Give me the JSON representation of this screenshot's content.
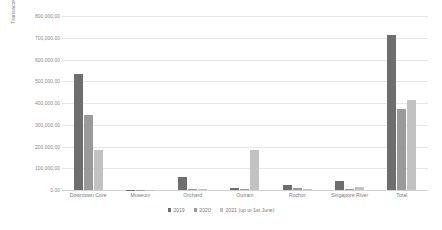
{
  "chart_data": {
    "type": "bar",
    "title": "",
    "xlabel": "",
    "ylabel": "Transacted Area (sqft)",
    "ylim": [
      0,
      800000
    ],
    "grid": true,
    "legend_position": "bottom",
    "categories": [
      "Downtown Core",
      "Museum",
      "Orchard",
      "Outram",
      "Rochor",
      "Singapore River",
      "Total"
    ],
    "ytick_labels": [
      "800,000.00",
      "700,000.00",
      "600,000.00",
      "500,000.00",
      "400,000.00",
      "300,000.00",
      "200,000.00",
      "100,000.00",
      "0.00"
    ],
    "ytick_values": [
      800000,
      700000,
      600000,
      500000,
      400000,
      300000,
      200000,
      100000,
      0
    ],
    "series": [
      {
        "name": "2019",
        "color": "#6e6e6e",
        "values": [
          535000,
          500,
          62000,
          9000,
          22000,
          42000,
          712000
        ]
      },
      {
        "name": "2020",
        "color": "#9a9a9a",
        "values": [
          345000,
          1200,
          5000,
          5000,
          11000,
          5000,
          372000
        ]
      },
      {
        "name": "2021 (up to 1st June)",
        "color": "#c2c2c2",
        "values": [
          182000,
          400,
          4000,
          185000,
          4000,
          12000,
          415000
        ]
      }
    ]
  }
}
